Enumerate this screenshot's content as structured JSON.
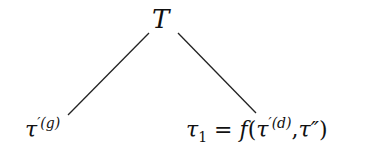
{
  "diagram": {
    "type": "tree",
    "root": {
      "label": "T"
    },
    "children": [
      {
        "base": "τ",
        "prime": "′",
        "superscript": "(g)"
      },
      {
        "lhs_base": "τ",
        "lhs_sub": "1",
        "equals": "=",
        "func": "f",
        "open": "(",
        "arg1_base": "τ",
        "arg1_prime": "′",
        "arg1_sup": "(d)",
        "comma": ",",
        "arg2": "τ″",
        "close": ")"
      }
    ],
    "edge_color": "#222222"
  }
}
